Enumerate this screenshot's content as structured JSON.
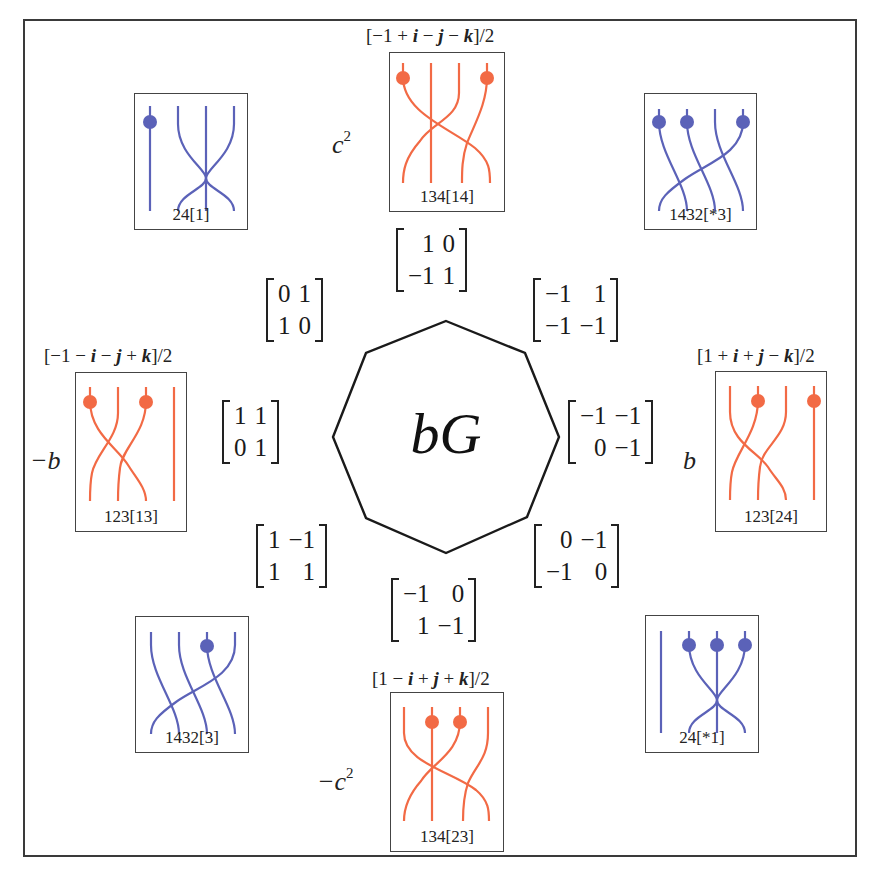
{
  "colors": {
    "blue_strand": "#5b62b8",
    "orange_strand": "#f26a45",
    "frame": "#3a3a3a",
    "text": "#222222"
  },
  "center": {
    "label": "bG",
    "shape": "octagon",
    "vertices": [
      [
        446,
        321
      ],
      [
        525,
        353
      ],
      [
        559,
        437
      ],
      [
        527,
        517
      ],
      [
        446,
        553
      ],
      [
        366,
        518
      ],
      [
        333,
        437
      ],
      [
        366,
        353
      ]
    ]
  },
  "braids": [
    {
      "id": "top",
      "label": "134[14]",
      "color": "orange",
      "quaternion": "[−1 + i − j − k]/2",
      "side_label": "c",
      "side_label_sup": "2"
    },
    {
      "id": "top-left",
      "label": "24[1]",
      "color": "blue",
      "quaternion": "",
      "side_label": "",
      "side_label_sup": ""
    },
    {
      "id": "top-right",
      "label": "1432[*3]",
      "color": "blue",
      "quaternion": "",
      "side_label": "",
      "side_label_sup": ""
    },
    {
      "id": "left",
      "label": "123[13]",
      "color": "orange",
      "quaternion": "[−1 − i − j + k]/2",
      "side_label": "−b",
      "side_label_sup": ""
    },
    {
      "id": "right",
      "label": "123[24]",
      "color": "orange",
      "quaternion": "[1 + i + j − k]/2",
      "side_label": "b",
      "side_label_sup": ""
    },
    {
      "id": "bottom-left",
      "label": "1432[3]",
      "color": "blue",
      "quaternion": "",
      "side_label": "",
      "side_label_sup": ""
    },
    {
      "id": "bottom-right",
      "label": "24[*1]",
      "color": "blue",
      "quaternion": "",
      "side_label": "",
      "side_label_sup": ""
    },
    {
      "id": "bottom",
      "label": "134[23]",
      "color": "orange",
      "quaternion": "[1 − i + j + k]/2",
      "side_label": "−c",
      "side_label_sup": "2"
    }
  ],
  "quaternions": {
    "top": {
      "open": "[−1 + ",
      "i": "i",
      "m1": " − ",
      "j": "j",
      "m2": " − ",
      "k": "k",
      "close": "]/2"
    },
    "left": {
      "open": "[−1 − ",
      "i": "i",
      "m1": " − ",
      "j": "j",
      "m2": " + ",
      "k": "k",
      "close": "]/2"
    },
    "right": {
      "open": "[1 + ",
      "i": "i",
      "m1": " + ",
      "j": "j",
      "m2": " − ",
      "k": "k",
      "close": "]/2"
    },
    "bottom": {
      "open": "[1 − ",
      "i": "i",
      "m1": " + ",
      "j": "j",
      "m2": " + ",
      "k": "k",
      "close": "]/2"
    }
  },
  "side_labels": {
    "top": {
      "base": "c",
      "sup": "2"
    },
    "left": {
      "base": "−b",
      "sup": ""
    },
    "right": {
      "base": "b",
      "sup": ""
    },
    "bottom": {
      "base": "−c",
      "sup": "2"
    }
  },
  "matrices": {
    "top": [
      [
        "1",
        "0"
      ],
      [
        "−1",
        "1"
      ]
    ],
    "upper_left": [
      [
        "0",
        "1"
      ],
      [
        "1",
        "0"
      ]
    ],
    "upper_right": [
      [
        "−1",
        "1"
      ],
      [
        "−1",
        "−1"
      ]
    ],
    "left": [
      [
        "1",
        "1"
      ],
      [
        "0",
        "1"
      ]
    ],
    "right": [
      [
        "−1",
        "−1"
      ],
      [
        "0",
        "−1"
      ]
    ],
    "lower_left": [
      [
        "1",
        "−1"
      ],
      [
        "1",
        "1"
      ]
    ],
    "lower_right": [
      [
        "0",
        "−1"
      ],
      [
        "−1",
        "0"
      ]
    ],
    "bottom": [
      [
        "−1",
        "0"
      ],
      [
        "1",
        "−1"
      ]
    ]
  }
}
